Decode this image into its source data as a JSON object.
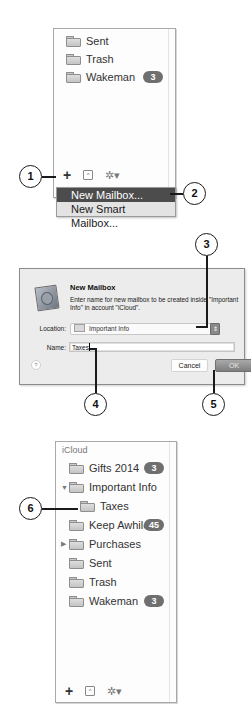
{
  "step1_panel": {
    "mailboxes": [
      {
        "name": "Sent",
        "icon": "folder-icon",
        "badge": null
      },
      {
        "name": "Trash",
        "icon": "folder-icon",
        "badge": null
      },
      {
        "name": "Wakeman",
        "icon": "folder-icon",
        "badge": "3"
      }
    ],
    "toolbar": {
      "add_icon": "+",
      "show_hide_icon": "^",
      "action_icon": "✲▾"
    },
    "add_menu": {
      "items": [
        {
          "label": "New Mailbox...",
          "selected": true
        },
        {
          "label": "New Smart Mailbox...",
          "selected": false
        }
      ]
    }
  },
  "dialog": {
    "title": "New Mailbox",
    "message": "Enter name for new mailbox to be created inside \"Important Info\" in account \"iCloud\".",
    "location_label": "Location:",
    "location_value": "Important Info",
    "stepper_glyph": "⇕",
    "name_label": "Name:",
    "name_value": "Taxes",
    "help_glyph": "?",
    "cancel_label": "Cancel",
    "ok_label": "OK"
  },
  "step6_panel": {
    "account_header": "iCloud",
    "mailboxes": [
      {
        "name": "Gifts 2014",
        "badge": "3",
        "disclosure": null,
        "indent": 0
      },
      {
        "name": "Important Info",
        "badge": null,
        "disclosure": "▼",
        "indent": 0
      },
      {
        "name": "Taxes",
        "badge": null,
        "disclosure": null,
        "indent": 1
      },
      {
        "name": "Keep Awhile",
        "badge": "45",
        "disclosure": null,
        "indent": 0
      },
      {
        "name": "Purchases",
        "badge": null,
        "disclosure": "▶",
        "indent": 0
      },
      {
        "name": "Sent",
        "badge": null,
        "disclosure": null,
        "indent": 0
      },
      {
        "name": "Trash",
        "badge": null,
        "disclosure": null,
        "indent": 0
      },
      {
        "name": "Wakeman",
        "badge": "3",
        "disclosure": null,
        "indent": 0
      }
    ],
    "toolbar": {
      "add_icon": "+",
      "show_hide_icon": "^",
      "action_icon": "✲▾"
    }
  },
  "callouts": [
    "1",
    "2",
    "3",
    "4",
    "5",
    "6"
  ]
}
